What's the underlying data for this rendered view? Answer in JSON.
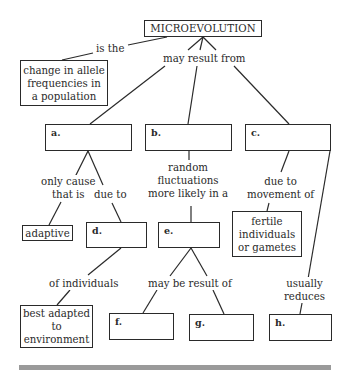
{
  "diagram": {
    "type": "concept-map",
    "root": {
      "label": "MICROEVOLUTION"
    },
    "definition_link": "is the",
    "definition": "change in allele frequencies in a population",
    "main_link": "may result from",
    "blanks": {
      "a": "a.",
      "b": "b.",
      "c": "c.",
      "d": "d.",
      "e": "e.",
      "f": "f.",
      "g": "g.",
      "h": "h."
    },
    "filled": {
      "adaptive": "adaptive",
      "fertile": "fertile individuals or gametes",
      "best_adapted": "best adapted to environment"
    },
    "links": {
      "a_to_adaptive_1": "only cause",
      "a_to_adaptive_2": "that is",
      "a_to_d": "due to",
      "b_to_e_1": "random",
      "b_to_e_2": "fluctuations",
      "b_to_e_3": "more likely in a",
      "c_to_fertile_1": "due to",
      "c_to_fertile_2": "movement of",
      "d_to_best": "of individuals",
      "e_to_fg": "may be result of",
      "c_to_h_1": "usually",
      "c_to_h_2": "reduces"
    },
    "colors": {
      "line": "#2a2a2a",
      "bar": "#9a9a9a",
      "background": "#ffffff"
    }
  }
}
